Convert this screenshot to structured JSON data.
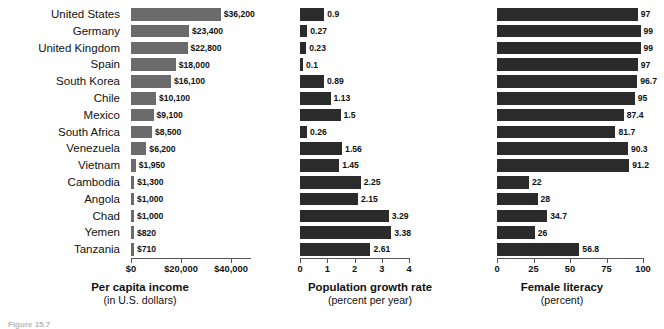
{
  "chart_data": [
    {
      "type": "bar",
      "orientation": "horizontal",
      "title": "",
      "xlabel": "Per capita income",
      "xlabel_sub": "(in U.S. dollars)",
      "ylabel": "",
      "categories": [
        "United States",
        "Germany",
        "United Kingdom",
        "Spain",
        "South Korea",
        "Chile",
        "Mexico",
        "South Africa",
        "Venezuela",
        "Vietnam",
        "Cambodia",
        "Angola",
        "Chad",
        "Yemen",
        "Tanzania"
      ],
      "values": [
        36200,
        23400,
        22800,
        18000,
        16100,
        10100,
        9100,
        8500,
        6200,
        1950,
        1300,
        1000,
        1000,
        820,
        710
      ],
      "value_labels": [
        "$36,200",
        "$23,400",
        "$22,800",
        "$18,000",
        "$16,100",
        "$10,100",
        "$9,100",
        "$8,500",
        "$6,200",
        "$1,950",
        "$1,300",
        "$1,000",
        "$1,000",
        "$820",
        "$710"
      ],
      "xlim": [
        0,
        48000
      ],
      "ticks": [
        0,
        20000,
        40000
      ],
      "tick_labels": [
        "$0",
        "$20,000",
        "$40,000"
      ],
      "bar_color": "#6b6b6b",
      "grid": false,
      "legend": "none"
    },
    {
      "type": "bar",
      "orientation": "horizontal",
      "title": "",
      "xlabel": "Population growth rate",
      "xlabel_sub": "(percent per year)",
      "ylabel": "",
      "categories": [
        "United States",
        "Germany",
        "United Kingdom",
        "Spain",
        "South Korea",
        "Chile",
        "Mexico",
        "South Africa",
        "Venezuela",
        "Vietnam",
        "Cambodia",
        "Angola",
        "Chad",
        "Yemen",
        "Tanzania"
      ],
      "values": [
        0.9,
        0.27,
        0.23,
        0.1,
        0.89,
        1.13,
        1.5,
        0.26,
        1.56,
        1.45,
        2.25,
        2.15,
        3.29,
        3.38,
        2.61
      ],
      "value_labels": [
        "0.9",
        "0.27",
        "0.23",
        "0.1",
        "0.89",
        "1.13",
        "1.5",
        "0.26",
        "1.56",
        "1.45",
        "2.25",
        "2.15",
        "3.29",
        "3.38",
        "2.61"
      ],
      "xlim": [
        0,
        4
      ],
      "ticks": [
        0,
        1,
        2,
        3,
        4
      ],
      "tick_labels": [
        "0",
        "1",
        "2",
        "3",
        "4"
      ],
      "bar_color": "#2b2b2b",
      "grid": false,
      "legend": "none"
    },
    {
      "type": "bar",
      "orientation": "horizontal",
      "title": "",
      "xlabel": "Female literacy",
      "xlabel_sub": "(percent)",
      "ylabel": "",
      "categories": [
        "United States",
        "Germany",
        "United Kingdom",
        "Spain",
        "South Korea",
        "Chile",
        "Mexico",
        "South Africa",
        "Venezuela",
        "Vietnam",
        "Cambodia",
        "Angola",
        "Chad",
        "Yemen",
        "Tanzania"
      ],
      "values": [
        97,
        99,
        99,
        97,
        96.7,
        95,
        87.4,
        81.7,
        90.3,
        91.2,
        22,
        28,
        34.7,
        26,
        56.8
      ],
      "value_labels": [
        "97",
        "99",
        "99",
        "97",
        "96.7",
        "95",
        "87.4",
        "81.7",
        "90.3",
        "91.2",
        "22",
        "28",
        "34.7",
        "26",
        "56.8"
      ],
      "xlim": [
        0,
        100
      ],
      "ticks": [
        0,
        25,
        50,
        75,
        100
      ],
      "tick_labels": [
        "0",
        "25",
        "50",
        "75",
        "100"
      ],
      "bar_color": "#2b2b2b",
      "grid": false,
      "legend": "none"
    }
  ],
  "caption": "Figure 15.7"
}
